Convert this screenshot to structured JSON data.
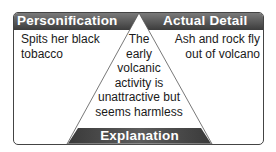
{
  "diagram": {
    "type": "triangle-organizer",
    "colors": {
      "band_top": "#7a7a7a",
      "band_bottom": "#3c3c3c",
      "border": "#444444",
      "text": "#1a1a1a",
      "label_text": "#ffffff"
    },
    "left": {
      "heading": "Personification",
      "text": "Spits her black tobacco"
    },
    "right": {
      "heading": "Actual Detail",
      "text": "Ash and rock fly out of volcano"
    },
    "center": {
      "heading": "Explanation",
      "text_lines": [
        "The",
        "early",
        "volcanic",
        "activity is",
        "unattractive but",
        "seems harmless"
      ]
    }
  }
}
